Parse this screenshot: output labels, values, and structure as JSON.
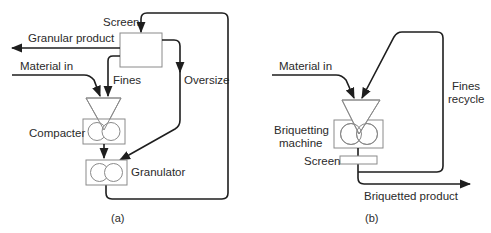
{
  "diagram_a": {
    "caption": "(a)",
    "labels": {
      "screen": "Screen",
      "granular_product": "Granular product",
      "material_in": "Material in",
      "fines": "Fines",
      "oversize": "Oversize",
      "compacter": "Compacter",
      "granulator": "Granulator"
    }
  },
  "diagram_b": {
    "caption": "(b)",
    "labels": {
      "material_in": "Material in",
      "fines_recycle_line1": "Fines",
      "fines_recycle_line2": "recycle",
      "briquetting_line1": "Briquetting",
      "briquetting_line2": "machine",
      "screen": "Screen",
      "briquetted_product": "Briquetted product"
    }
  },
  "colors": {
    "flow_line": "#1e1e1e",
    "equipment_outline": "#8a8a8a",
    "text": "#2a2a2a"
  }
}
